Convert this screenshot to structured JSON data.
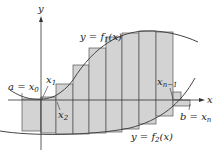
{
  "diagram": {
    "colors": {
      "rect_fill": "#d3d3d3",
      "rect_stroke": "#555555",
      "curve": "#444444",
      "axis": "#333333",
      "background": "#ffffff"
    },
    "axes": {
      "x_label": "x",
      "y_label": "y"
    },
    "curves": {
      "upper": {
        "label_prefix": "y = f",
        "label_sub": "1",
        "label_suffix": "(x)"
      },
      "lower": {
        "label_prefix": "y = f",
        "label_sub": "2",
        "label_suffix": "(x)"
      }
    },
    "labels": {
      "a_eq": "a = x",
      "a_sub": "0",
      "x1": "x",
      "x1_sub": "1",
      "x2": "x",
      "x2_sub": "2",
      "xn1": "x",
      "xn1_sub": "n−1",
      "b_eq": "b = x",
      "b_sub": "n"
    },
    "rectangles": [
      {
        "x": 22,
        "w": 19,
        "top": 99,
        "bottom": 131
      },
      {
        "x": 41,
        "w": 15,
        "top": 97,
        "bottom": 133
      },
      {
        "x": 56,
        "w": 17,
        "top": 84,
        "bottom": 134
      },
      {
        "x": 73,
        "w": 16,
        "top": 65,
        "bottom": 134
      },
      {
        "x": 89,
        "w": 17,
        "top": 48,
        "bottom": 133
      },
      {
        "x": 106,
        "w": 16,
        "top": 37,
        "bottom": 132
      },
      {
        "x": 122,
        "w": 17,
        "top": 33,
        "bottom": 129
      },
      {
        "x": 139,
        "w": 17,
        "top": 31,
        "bottom": 124
      },
      {
        "x": 156,
        "w": 17,
        "top": 32,
        "bottom": 116
      },
      {
        "x": 173,
        "w": 8,
        "top": 92,
        "bottom": 100
      },
      {
        "x": 173,
        "w": 17,
        "top": 100,
        "bottom": 106
      }
    ]
  }
}
